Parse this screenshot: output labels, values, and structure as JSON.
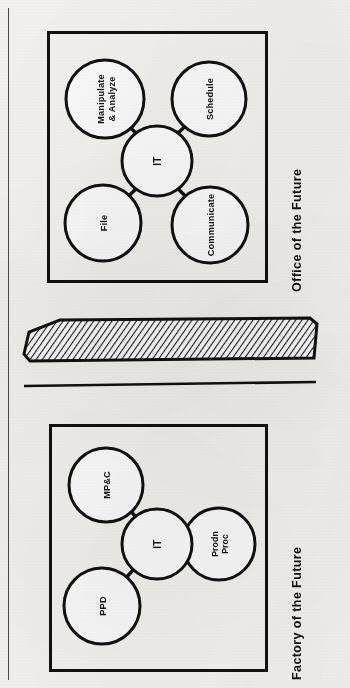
{
  "page": {
    "background_color": "#f7f6f2",
    "ink_color": "#111111",
    "text_orientation": "rotated-90-ccw"
  },
  "margin_rule": {
    "label": "page-margin-rule"
  },
  "office": {
    "caption": "Office of the Future",
    "hub": {
      "label": "IT"
    },
    "nodes": [
      {
        "id": "manipulate",
        "label_line1": "Manipulate",
        "label_line2": "& Analyze"
      },
      {
        "id": "schedule",
        "label_line1": "Schedule",
        "label_line2": ""
      },
      {
        "id": "file",
        "label_line1": "File",
        "label_line2": ""
      },
      {
        "id": "communicate",
        "label_line1": "Communicate",
        "label_line2": ""
      }
    ]
  },
  "factory": {
    "caption": "Factory of the Future",
    "hub": {
      "label": "IT"
    },
    "nodes": [
      {
        "id": "mpc",
        "label_line1": "MP&C",
        "label_line2": ""
      },
      {
        "id": "ppd",
        "label_line1": "PPD",
        "label_line2": ""
      },
      {
        "id": "prodn",
        "label_line1": "Prodn",
        "label_line2": "Proc"
      }
    ]
  },
  "connector_band": {
    "name": "hatched-slab",
    "fill_pattern": "diagonal-hatch",
    "hatch_color": "#1a1a1a"
  }
}
